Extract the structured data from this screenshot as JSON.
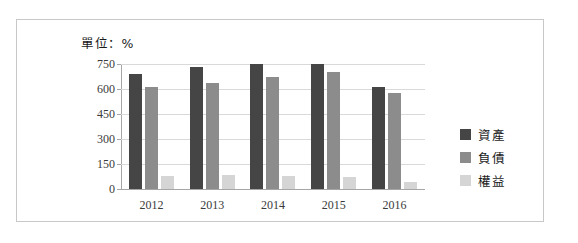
{
  "unit_label": "單位：%",
  "chart_data": {
    "type": "bar",
    "title": "單位：%",
    "xlabel": "",
    "ylabel": "",
    "categories": [
      "2012",
      "2013",
      "2014",
      "2015",
      "2016"
    ],
    "series": [
      {
        "name": "資產",
        "color": "#454545",
        "values": [
          690,
          730,
          748,
          752,
          615
        ]
      },
      {
        "name": "負債",
        "color": "#8c8c8c",
        "values": [
          610,
          635,
          675,
          700,
          575
        ]
      },
      {
        "name": "權益",
        "color": "#d5d5d5",
        "values": [
          78,
          85,
          80,
          72,
          40
        ]
      }
    ],
    "ylim": [
      0,
      750
    ],
    "yticks": [
      0,
      150,
      300,
      450,
      600,
      750
    ],
    "ytick_labels": [
      "0",
      "150",
      "300",
      "450",
      "600",
      "750"
    ],
    "grid": true,
    "legend_position": "right"
  }
}
